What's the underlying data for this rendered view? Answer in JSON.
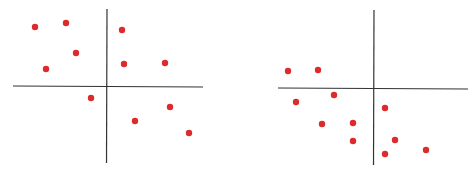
{
  "chart_data": [
    {
      "type": "scatter",
      "title": "",
      "xlabel": "",
      "ylabel": "",
      "grid": false,
      "legend": null,
      "axes_style": "cross-through-origin",
      "point_color": "#dd2a2a",
      "axis_color": "#333333",
      "pixel_frame": {
        "origin": [
          107,
          86
        ],
        "x_axis": [
          13,
          203
        ],
        "y_axis": [
          9,
          163
        ]
      },
      "points": [
        {
          "x": -72,
          "y": 59
        },
        {
          "x": -41,
          "y": 63
        },
        {
          "x": -31,
          "y": 33
        },
        {
          "x": -61,
          "y": 17
        },
        {
          "x": 15,
          "y": 56
        },
        {
          "x": 17,
          "y": 22
        },
        {
          "x": 58,
          "y": 23
        },
        {
          "x": -16,
          "y": -12
        },
        {
          "x": 63,
          "y": -21
        },
        {
          "x": 28,
          "y": -35
        },
        {
          "x": 82,
          "y": -47
        }
      ]
    },
    {
      "type": "scatter",
      "title": "",
      "xlabel": "",
      "ylabel": "",
      "grid": false,
      "legend": null,
      "axes_style": "cross-through-origin",
      "point_color": "#dd2a2a",
      "axis_color": "#333333",
      "pixel_frame": {
        "origin": [
          374,
          88
        ],
        "x_axis": [
          278,
          468
        ],
        "y_axis": [
          10,
          165
        ]
      },
      "points": [
        {
          "x": -86,
          "y": 17
        },
        {
          "x": -56,
          "y": 18
        },
        {
          "x": -78,
          "y": -14
        },
        {
          "x": -40,
          "y": -7
        },
        {
          "x": -52,
          "y": -36
        },
        {
          "x": -21,
          "y": -35
        },
        {
          "x": -21,
          "y": -53
        },
        {
          "x": 11,
          "y": -20
        },
        {
          "x": 21,
          "y": -52
        },
        {
          "x": 11,
          "y": -66
        },
        {
          "x": 52,
          "y": -62
        }
      ]
    }
  ]
}
